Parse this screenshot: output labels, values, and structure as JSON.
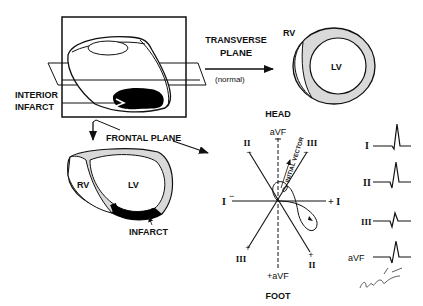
{
  "diagram": {
    "top_left": {
      "label_infarct": [
        "INTERIOR",
        "INFARCT"
      ]
    },
    "transverse": {
      "label": [
        "TRANSVERSE",
        "PLANE"
      ],
      "sub": "(normal)",
      "rv": "RV",
      "lv": "LV"
    },
    "frontal": {
      "label": "FRONTAL PLANE",
      "rv": "RV",
      "lv": "LV",
      "infarct": "INFARCT"
    },
    "axes": {
      "head": "HEAD",
      "foot": "FOOT",
      "avf_top": "aVF",
      "avf_bottom": "+aVF",
      "lead_ii_top": "II",
      "lead_iii_top": "III",
      "lead_i_left": "I",
      "lead_i_right": "+ I",
      "lead_iii_bottom": "III",
      "lead_ii_bottom": "II",
      "initial_vector": "INITIAL VECTOR",
      "minus": "−",
      "plus": "+"
    },
    "ecg": {
      "leads": [
        {
          "name": "I"
        },
        {
          "name": "II"
        },
        {
          "name": "III"
        },
        {
          "name": "aVF"
        }
      ]
    }
  },
  "colors": {
    "ink": "#111111",
    "wall": "#d9d9d9",
    "infarct": "#000000",
    "background": "#ffffff"
  }
}
